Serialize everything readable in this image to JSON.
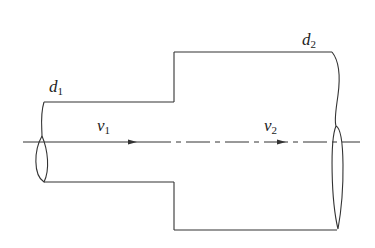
{
  "diagram": {
    "type": "pipe-expansion",
    "labels": {
      "d1": {
        "base": "d",
        "sub": "1"
      },
      "d2": {
        "base": "d",
        "sub": "2"
      },
      "v1": {
        "base": "v",
        "sub": "1"
      },
      "v2": {
        "base": "v",
        "sub": "2"
      }
    },
    "colors": {
      "line": "#333333",
      "background": "#ffffff"
    }
  }
}
